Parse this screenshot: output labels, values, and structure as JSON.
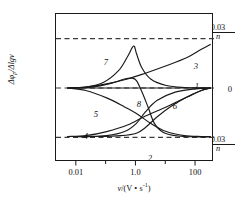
{
  "chart_data": {
    "type": "line",
    "title": "",
    "xlabel": "v/(V · s⁻¹)",
    "ylabel": "Δφp/Δlgv",
    "xscale": "log",
    "xlim": [
      0.002,
      400
    ],
    "ylim": [
      -0.045,
      0.045
    ],
    "grid": false,
    "legend_position": "inline-labels",
    "x_ticks": [
      {
        "value": 0.01,
        "label": "0.01"
      },
      {
        "value": 1.0,
        "label": "1.0"
      },
      {
        "value": 100,
        "label": "100"
      }
    ],
    "x_minor_ticks": [
      0.1,
      10
    ],
    "y_ticks": [
      {
        "value": 0.03,
        "label_numerator": "0.03",
        "label_denominator": "n"
      },
      {
        "value": 0.0,
        "label": "0"
      },
      {
        "value": -0.03,
        "label_numerator": "0.03",
        "label_denominator": "n"
      }
    ],
    "reference_lines": [
      {
        "y": 0.03,
        "style": "dashed",
        "label": "0.03/n"
      },
      {
        "y": 0.0,
        "style": "dashed",
        "label": "0"
      },
      {
        "y": -0.03,
        "style": "dashed",
        "label": "0.03/n"
      }
    ],
    "series": [
      {
        "name": "1",
        "label": "1",
        "points": [
          [
            0.005,
            0.0
          ],
          [
            0.01,
            0.0
          ],
          [
            0.05,
            0.0
          ],
          [
            0.2,
            0.0
          ],
          [
            1.0,
            0.0
          ],
          [
            5.0,
            0.0
          ],
          [
            20,
            0.0
          ],
          [
            100,
            0.0
          ],
          [
            300,
            0.0
          ]
        ]
      },
      {
        "name": "2",
        "label": "2",
        "points": [
          [
            0.005,
            -0.0295
          ],
          [
            0.02,
            -0.0295
          ],
          [
            0.1,
            -0.029
          ],
          [
            0.4,
            -0.0265
          ],
          [
            1.0,
            -0.0215
          ],
          [
            2.0,
            -0.0145
          ],
          [
            5.0,
            -0.0075
          ],
          [
            20,
            -0.0025
          ],
          [
            100,
            -0.0005
          ],
          [
            300,
            0.0
          ]
        ]
      },
      {
        "name": "3",
        "label": "3",
        "points": [
          [
            0.005,
            0.0
          ],
          [
            0.02,
            0.0005
          ],
          [
            0.1,
            0.0025
          ],
          [
            0.5,
            0.0055
          ],
          [
            2.0,
            0.009
          ],
          [
            10,
            0.0135
          ],
          [
            50,
            0.0185
          ],
          [
            150,
            0.0235
          ],
          [
            300,
            0.0265
          ]
        ]
      },
      {
        "name": "4",
        "label": "4",
        "points": [
          [
            0.005,
            -0.0295
          ],
          [
            0.02,
            -0.029
          ],
          [
            0.1,
            -0.0265
          ],
          [
            0.5,
            -0.0225
          ],
          [
            2.0,
            -0.017
          ],
          [
            10,
            -0.0115
          ],
          [
            50,
            -0.0055
          ],
          [
            150,
            -0.0015
          ],
          [
            300,
            0.0
          ]
        ]
      },
      {
        "name": "5",
        "label": "5",
        "points": [
          [
            0.005,
            0.0
          ],
          [
            0.02,
            -0.0015
          ],
          [
            0.1,
            -0.006
          ],
          [
            0.4,
            -0.0115
          ],
          [
            1.0,
            -0.0155
          ],
          [
            3.0,
            -0.0215
          ],
          [
            10,
            -0.0265
          ],
          [
            40,
            -0.029
          ],
          [
            150,
            -0.0295
          ],
          [
            300,
            -0.0295
          ]
        ]
      },
      {
        "name": "6",
        "label": "6",
        "points": [
          [
            0.005,
            -0.0295
          ],
          [
            0.05,
            -0.0295
          ],
          [
            0.3,
            -0.029
          ],
          [
            1.0,
            -0.0275
          ],
          [
            2.0,
            -0.024
          ],
          [
            5.0,
            -0.0175
          ],
          [
            15,
            -0.011
          ],
          [
            50,
            -0.0055
          ],
          [
            150,
            -0.0015
          ],
          [
            300,
            0.0
          ]
        ]
      },
      {
        "name": "7",
        "label": "7",
        "points": [
          [
            0.005,
            0.0
          ],
          [
            0.02,
            0.0005
          ],
          [
            0.08,
            0.0035
          ],
          [
            0.25,
            0.0105
          ],
          [
            0.5,
            0.019
          ],
          [
            0.8,
            0.0255
          ],
          [
            1.0,
            0.021
          ],
          [
            1.5,
            0.0125
          ],
          [
            3.0,
            0.0055
          ],
          [
            10,
            0.0015
          ],
          [
            40,
            0.0003
          ],
          [
            300,
            0.0
          ]
        ]
      },
      {
        "name": "8",
        "label": "8",
        "points": [
          [
            0.005,
            0.0
          ],
          [
            0.03,
            0.0005
          ],
          [
            0.15,
            0.003
          ],
          [
            0.4,
            0.0055
          ],
          [
            0.7,
            0.006
          ],
          [
            1.0,
            0.0045
          ],
          [
            1.5,
            -0.002
          ],
          [
            2.5,
            -0.012
          ],
          [
            4.0,
            -0.0215
          ],
          [
            8.0,
            -0.027
          ],
          [
            25,
            -0.0292
          ],
          [
            100,
            -0.0297
          ],
          [
            300,
            -0.0297
          ]
        ]
      }
    ],
    "annotations": [
      {
        "text": "7",
        "x_px": 106,
        "y_px": 62
      },
      {
        "text": "3",
        "x_px": 196,
        "y_px": 66
      },
      {
        "text": "1",
        "x_px": 197,
        "y_px": 86
      },
      {
        "text": "8",
        "x_px": 139,
        "y_px": 104
      },
      {
        "text": "6",
        "x_px": 175,
        "y_px": 106
      },
      {
        "text": "5",
        "x_px": 96,
        "y_px": 114
      },
      {
        "text": "4",
        "x_px": 86,
        "y_px": 136
      },
      {
        "text": "2",
        "x_px": 150,
        "y_px": 158
      }
    ]
  },
  "axis": {
    "y_top_numerator": "0.03",
    "y_top_denominator": "n",
    "y_zero": "0",
    "y_bottom_numerator": "0.03",
    "y_bottom_denominator": "n",
    "y_title_prefix": "Δφ",
    "y_title_sub": "p",
    "y_title_suffix": "/Δlg",
    "y_title_var": "v",
    "x_title_var": "v",
    "x_title_unit_open": "/(V • s",
    "x_title_unit_sup": "-1",
    "x_title_unit_close": ")",
    "x_tick_labels": [
      "0.01",
      "1.0",
      "100"
    ]
  },
  "colors": {
    "axis": "#1a1a1a",
    "curve": "#1a1a1a",
    "dashed": "#3a3a3a",
    "background": "#ffffff"
  }
}
